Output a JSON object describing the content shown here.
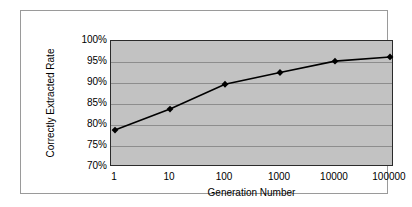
{
  "chart_data": {
    "type": "line",
    "title": "",
    "subtitle": "",
    "xlabel": "Generation Number",
    "ylabel": "Correctly Extracted Rate",
    "categories": [
      "1",
      "10",
      "100",
      "1000",
      "10000",
      "100000"
    ],
    "x": [
      1,
      10,
      100,
      1000,
      10000,
      100000
    ],
    "x_scale": "log-categorical",
    "values": [
      78.8,
      83.8,
      89.7,
      92.5,
      95.2,
      96.2
    ],
    "value_unit": "%",
    "series": [
      {
        "name": "Correctly Extracted Rate",
        "values": [
          78.8,
          83.8,
          89.7,
          92.5,
          95.2,
          96.2
        ],
        "marker": "diamond",
        "marker_color": "#000000",
        "line_color": "#000000"
      }
    ],
    "ylim": [
      70,
      100
    ],
    "ytick_step": 5,
    "ytick_labels": [
      "100%",
      "95%",
      "90%",
      "85%",
      "80%",
      "75%",
      "70%"
    ],
    "ytick_values": [
      100,
      95,
      90,
      85,
      80,
      75,
      70
    ],
    "xtick_labels": [
      "1",
      "10",
      "100",
      "1000",
      "10000",
      "100000"
    ],
    "grid": {
      "horizontal": true,
      "vertical": false,
      "color": "#8d8d8d"
    },
    "legend": {
      "visible": false,
      "position": "none",
      "entries": []
    },
    "plot_background": "#c2c2c2",
    "figure_background": "#ffffff",
    "axis_color": "#2b2b2b"
  }
}
